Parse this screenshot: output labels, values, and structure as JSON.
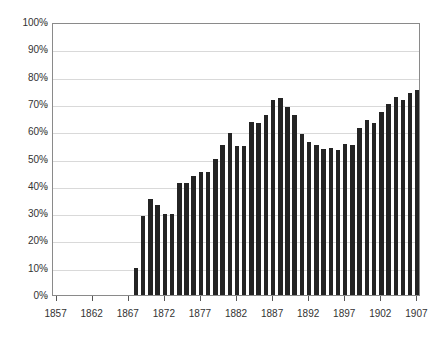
{
  "chart_data": {
    "type": "bar",
    "title": "",
    "subtitle": "",
    "xlabel": "",
    "ylabel": "",
    "grid": true,
    "legend": "none",
    "xlim": [
      1857,
      1907
    ],
    "ylim": [
      0,
      100
    ],
    "y_tick_labels": [
      "100%",
      "90%",
      "80%",
      "70%",
      "60%",
      "50%",
      "40%",
      "30%",
      "20%",
      "10%",
      "0%"
    ],
    "y_tick_values": [
      100,
      90,
      80,
      70,
      60,
      50,
      40,
      30,
      20,
      10,
      0
    ],
    "x_tick_labels": [
      "1857",
      "1862",
      "1867",
      "1872",
      "1877",
      "1882",
      "1887",
      "1892",
      "1897",
      "1902",
      "1907"
    ],
    "x_tick_values": [
      1857,
      1862,
      1867,
      1872,
      1877,
      1882,
      1887,
      1892,
      1897,
      1902,
      1907
    ],
    "bar_color": "#242424",
    "grid_color": "#d9d9d9",
    "frame_color": "#8a8a8a",
    "categories": [
      1857,
      1858,
      1859,
      1860,
      1861,
      1862,
      1863,
      1864,
      1865,
      1866,
      1867,
      1868,
      1869,
      1870,
      1871,
      1872,
      1873,
      1874,
      1875,
      1876,
      1877,
      1878,
      1879,
      1880,
      1881,
      1882,
      1883,
      1884,
      1885,
      1886,
      1887,
      1888,
      1889,
      1890,
      1891,
      1892,
      1893,
      1894,
      1895,
      1896,
      1897,
      1898,
      1899,
      1900,
      1901,
      1902,
      1903,
      1904,
      1905,
      1906,
      1907
    ],
    "values": [
      0,
      0,
      0,
      0,
      0,
      0,
      0,
      0,
      0,
      0,
      0,
      10,
      29,
      35,
      33,
      29.5,
      29.5,
      41,
      41,
      43.5,
      45,
      45,
      50,
      55,
      59.5,
      54.5,
      54.5,
      63.5,
      63,
      66,
      71.5,
      72,
      69,
      66,
      59,
      56,
      55,
      53.5,
      54,
      53,
      55.5,
      55,
      61,
      64,
      63,
      67,
      70,
      72.5,
      71.5,
      74,
      75
    ],
    "series": [
      {
        "name": "",
        "values": [
          0,
          0,
          0,
          0,
          0,
          0,
          0,
          0,
          0,
          0,
          0,
          10,
          29,
          35,
          33,
          29.5,
          29.5,
          41,
          41,
          43.5,
          45,
          45,
          50,
          55,
          59.5,
          54.5,
          54.5,
          63.5,
          63,
          66,
          71.5,
          72,
          69,
          66,
          59,
          56,
          55,
          53.5,
          54,
          53,
          55.5,
          55,
          61,
          64,
          63,
          67,
          70,
          72.5,
          71.5,
          74,
          75
        ]
      }
    ]
  }
}
